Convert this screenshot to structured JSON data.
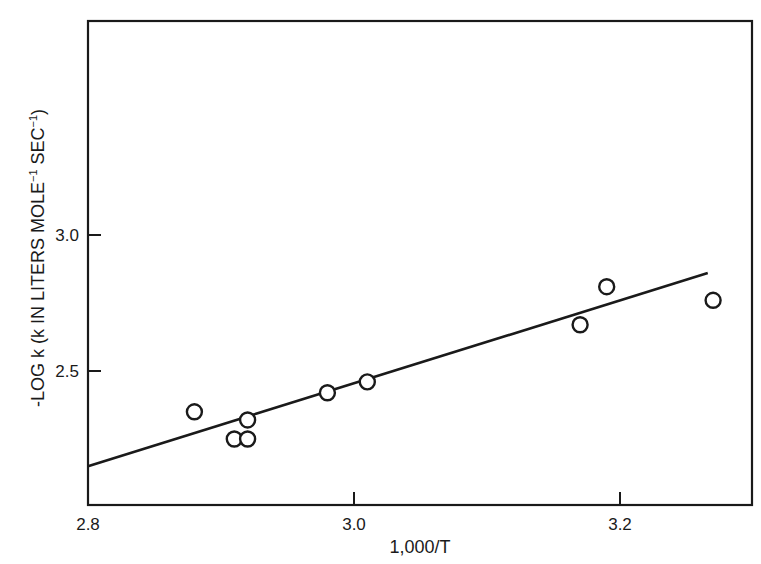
{
  "chart_data": {
    "type": "scatter",
    "title": "",
    "xlabel": "1,000/T",
    "ylabel": "-LOG k (k IN LITERS MOLE⁻¹ SEC⁻¹)",
    "xlim": [
      2.8,
      3.3
    ],
    "ylim": [
      2.11,
      3.98
    ],
    "x_ticks": [
      2.8,
      3.0,
      3.2
    ],
    "x_tick_labels": [
      "2.8",
      "3.0",
      "3.2"
    ],
    "y_ticks": [
      2.5,
      3.0
    ],
    "y_tick_labels": [
      "2.5",
      "3.0"
    ],
    "grid": false,
    "legend": null,
    "series": [
      {
        "name": "observed",
        "marker": "open-circle",
        "x": [
          2.88,
          2.91,
          2.92,
          2.92,
          2.98,
          3.01,
          3.17,
          3.19,
          3.27
        ],
        "y": [
          2.35,
          2.25,
          2.32,
          2.25,
          2.42,
          2.46,
          2.67,
          2.81,
          2.76
        ]
      },
      {
        "name": "fit line",
        "style": "line",
        "x": [
          2.8,
          3.266
        ],
        "y": [
          2.15,
          2.86
        ]
      }
    ]
  },
  "labels": {
    "xlabel": "1,000/T",
    "ylabel_main": "-LOG k (k IN LITERS MOLE",
    "ylabel_sup1": "−1",
    "ylabel_mid": " SEC",
    "ylabel_sup2": "−1",
    "ylabel_end": ")"
  },
  "colors": {
    "ink": "#1a1a1a",
    "background": "#ffffff"
  }
}
